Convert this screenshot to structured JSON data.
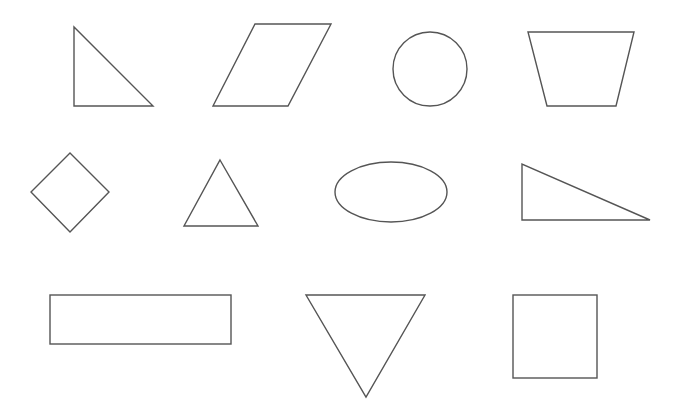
{
  "canvas": {
    "width": 681,
    "height": 404,
    "background": "#ffffff",
    "stroke_color": "#555555"
  },
  "shapes": [
    {
      "name": "right-triangle",
      "type": "polygon",
      "points": "74,27 74,106 153,106"
    },
    {
      "name": "parallelogram",
      "type": "polygon",
      "points": "255,24 331,24 288,106 213,106"
    },
    {
      "name": "circle",
      "type": "circle",
      "cx": 430,
      "cy": 69,
      "r": 37
    },
    {
      "name": "trapezoid",
      "type": "polygon",
      "points": "528,32 634,32 616,106 547,106"
    },
    {
      "name": "diamond",
      "type": "polygon",
      "points": "70,153 109,192 70,232 31,192"
    },
    {
      "name": "equilateral-triangle",
      "type": "polygon",
      "points": "220,160 258,226 184,226"
    },
    {
      "name": "ellipse",
      "type": "ellipse",
      "cx": 391,
      "cy": 192,
      "rx": 56,
      "ry": 30
    },
    {
      "name": "wide-right-triangle",
      "type": "polygon",
      "points": "522,164 522,220 650,220"
    },
    {
      "name": "rectangle",
      "type": "rect",
      "x": 50,
      "y": 295,
      "width": 181,
      "height": 49
    },
    {
      "name": "inverted-triangle",
      "type": "polygon",
      "points": "306,295 425,295 366,397"
    },
    {
      "name": "square",
      "type": "rect",
      "x": 513,
      "y": 295,
      "width": 84,
      "height": 83
    }
  ]
}
